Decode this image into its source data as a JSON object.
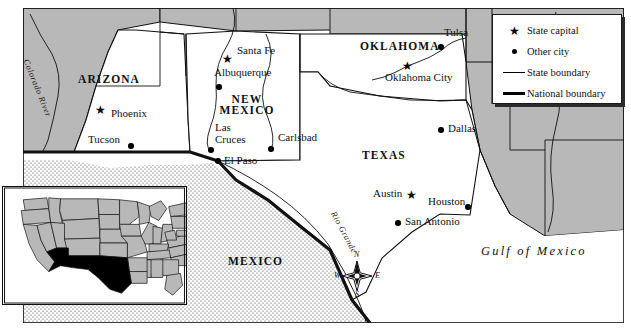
{
  "map": {
    "title": "Southwestern United States and Northern Mexico Reference Map",
    "colors": {
      "land_fill": "#ffffff",
      "neighbor_state_fill": "#b8b8b8",
      "mexico_stipple": "#ffffff",
      "boundary": "#111111",
      "frame": "#111111",
      "legend_bg": "#ffffff",
      "legend_shadow": "#2b2b2b",
      "inset_highlight": "#000000",
      "inset_other_states": "#b8b8b8"
    },
    "states": [
      {
        "name": "ARIZONA",
        "x": 108,
        "y": 80
      },
      {
        "name": "NEW MEXICO",
        "x": 243,
        "y": 100
      },
      {
        "name": "OKLAHOMA",
        "x": 396,
        "y": 47
      },
      {
        "name": "TEXAS",
        "x": 385,
        "y": 155
      },
      {
        "name": "MEXICO",
        "x": 256,
        "y": 262
      }
    ],
    "cities": [
      {
        "name": "Santa Fe",
        "type": "capital",
        "marker_x": 228,
        "marker_y": 60,
        "label_x": 237,
        "label_y": 50
      },
      {
        "name": "Albuquerque",
        "type": "city",
        "marker_x": 219,
        "marker_y": 87,
        "label_x": 215,
        "label_y": 72
      },
      {
        "name": "Las Cruces",
        "type": "city",
        "marker_x": 211,
        "marker_y": 150,
        "label_x": 215,
        "label_y": 126
      },
      {
        "name": "Carlsbad",
        "type": "city",
        "marker_x": 271,
        "marker_y": 149,
        "label_x": 281,
        "label_y": 137
      },
      {
        "name": "El Paso",
        "type": "city",
        "marker_x": 218,
        "marker_y": 161,
        "label_x": 226,
        "label_y": 159
      },
      {
        "name": "Phoenix",
        "type": "capital",
        "marker_x": 101,
        "marker_y": 111,
        "label_x": 113,
        "label_y": 113
      },
      {
        "name": "Tucson",
        "type": "city",
        "marker_x": 130,
        "marker_y": 146,
        "label_x": 90,
        "label_y": 139
      },
      {
        "name": "Oklahoma City",
        "type": "capital",
        "marker_x": 408,
        "marker_y": 67,
        "label_x": 388,
        "label_y": 76
      },
      {
        "name": "Tulsa",
        "type": "city",
        "marker_x": 441,
        "marker_y": 47,
        "label_x": 446,
        "label_y": 31
      },
      {
        "name": "Dallas",
        "type": "city",
        "marker_x": 441,
        "marker_y": 130,
        "label_x": 450,
        "label_y": 128
      },
      {
        "name": "Austin",
        "type": "capital",
        "marker_x": 412,
        "marker_y": 196,
        "label_x": 375,
        "label_y": 190
      },
      {
        "name": "Houston",
        "type": "city",
        "marker_x": 468,
        "marker_y": 207,
        "label_x": 430,
        "label_y": 200
      },
      {
        "name": "San Antonio",
        "type": "city",
        "marker_x": 398,
        "marker_y": 223,
        "label_x": 407,
        "label_y": 218
      }
    ],
    "water_labels": [
      {
        "name": "Gulf of Mexico",
        "x": 485,
        "y": 246
      }
    ],
    "rivers": [
      {
        "name": "Colorado River",
        "x": 43,
        "y": 60,
        "rotate": 68
      },
      {
        "name": "Rio Grande",
        "x": 339,
        "y": 212,
        "rotate": 62
      }
    ],
    "compass": {
      "center_x": 357,
      "center_y": 276,
      "north": "N",
      "south": "S",
      "east": "E",
      "west": "W"
    }
  },
  "legend": {
    "items": [
      {
        "symbol": "star",
        "label": "State capital"
      },
      {
        "symbol": "dot",
        "label": "Other city"
      },
      {
        "symbol": "thin-line",
        "label": "State boundary"
      },
      {
        "symbol": "thick-line",
        "label": "National boundary"
      }
    ]
  },
  "inset": {
    "label": "United States locator map",
    "highlighted_states": [
      "Arizona",
      "New Mexico",
      "Texas",
      "Oklahoma"
    ]
  }
}
